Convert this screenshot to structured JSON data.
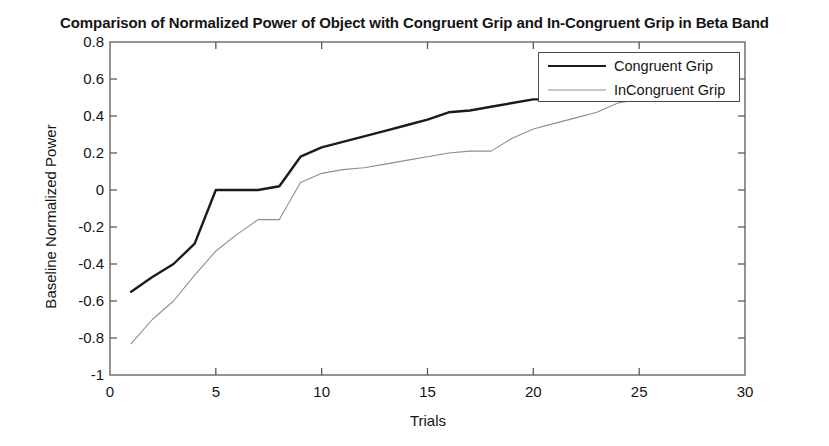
{
  "chart_data": {
    "type": "line",
    "title": "Comparison of Normalized Power of Object with Congruent Grip and In-Congruent Grip in Beta Band",
    "xlabel": "Trials",
    "ylabel": "Baseline Normalized Power",
    "xlim": [
      0,
      30
    ],
    "ylim": [
      -1,
      0.8
    ],
    "xticks": [
      0,
      5,
      10,
      15,
      20,
      25,
      30
    ],
    "yticks": [
      -1,
      -0.8,
      -0.6,
      -0.4,
      -0.2,
      0,
      0.2,
      0.4,
      0.6,
      0.8
    ],
    "ytick_labels": [
      "-1",
      "-0.8",
      "-0.6",
      "-0.4",
      "-0.2",
      "0",
      "0.2",
      "0.4",
      "0.6",
      "0.8"
    ],
    "xtick_labels": [
      "0",
      "5",
      "10",
      "15",
      "20",
      "25",
      "30"
    ],
    "grid": false,
    "legend_position": "upper right",
    "series": [
      {
        "name": "Congruent Grip",
        "color": "#1b1b1b",
        "linewidth": 2.4,
        "x": [
          1,
          2,
          3,
          4,
          5,
          6,
          7,
          8,
          9,
          10,
          11,
          12,
          13,
          14,
          15,
          16,
          17,
          18,
          19,
          20,
          21,
          22,
          23,
          24,
          25
        ],
        "values": [
          -0.55,
          -0.47,
          -0.4,
          -0.29,
          0.0,
          0.0,
          0.0,
          0.02,
          0.18,
          0.23,
          0.26,
          0.29,
          0.32,
          0.35,
          0.38,
          0.42,
          0.43,
          0.45,
          0.47,
          0.49,
          0.49,
          0.49,
          0.49,
          0.49,
          0.49
        ]
      },
      {
        "name": "InCongruent Grip",
        "color": "#8e8e8e",
        "linewidth": 1.1,
        "x": [
          1,
          2,
          3,
          4,
          5,
          6,
          7,
          8,
          9,
          10,
          11,
          12,
          13,
          14,
          15,
          16,
          17,
          18,
          19,
          20,
          21,
          22,
          23,
          24,
          25
        ],
        "values": [
          -0.83,
          -0.7,
          -0.6,
          -0.46,
          -0.33,
          -0.24,
          -0.16,
          -0.16,
          0.04,
          0.09,
          0.11,
          0.12,
          0.14,
          0.16,
          0.18,
          0.2,
          0.21,
          0.21,
          0.28,
          0.33,
          0.36,
          0.39,
          0.42,
          0.47,
          0.49
        ]
      }
    ]
  },
  "legend": {
    "items": [
      {
        "label": "Congruent Grip"
      },
      {
        "label": "InCongruent Grip"
      }
    ]
  }
}
